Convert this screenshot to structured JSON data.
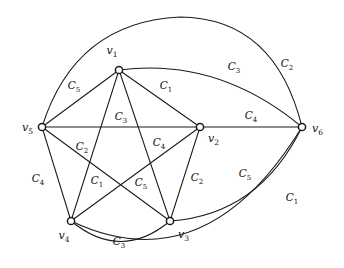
{
  "figure": {
    "kind": "graph-diagram",
    "width": 344,
    "height": 268,
    "background_color": "#ffffff",
    "stroke_color": "#1a1a1a",
    "vertex_fill": "#ffffff"
  },
  "vertices": [
    {
      "id": "v1",
      "label": "v",
      "sub": "1",
      "x": 119,
      "y": 70,
      "label_x": 112,
      "label_y": 54,
      "anchor": "middle"
    },
    {
      "id": "v2",
      "label": "v",
      "sub": "2",
      "x": 200,
      "y": 127,
      "label_x": 208,
      "label_y": 142,
      "anchor": "start"
    },
    {
      "id": "v3",
      "label": "v",
      "sub": "3",
      "x": 170,
      "y": 221,
      "label_x": 178,
      "label_y": 238,
      "anchor": "start"
    },
    {
      "id": "v4",
      "label": "v",
      "sub": "4",
      "x": 71,
      "y": 221,
      "label_x": 64,
      "label_y": 239,
      "anchor": "middle"
    },
    {
      "id": "v5",
      "label": "v",
      "sub": "5",
      "x": 42,
      "y": 127,
      "label_x": 33,
      "label_y": 131,
      "anchor": "end"
    },
    {
      "id": "v6",
      "label": "v",
      "sub": "6",
      "x": 302,
      "y": 127,
      "label_x": 312,
      "label_y": 132,
      "anchor": "start"
    }
  ],
  "edges": [
    {
      "from": "v1",
      "to": "v2",
      "color_label": "C",
      "color_sub": "1",
      "shape": "line",
      "path": "M 119 70 L 200 127",
      "label_x": 166,
      "label_y": 89
    },
    {
      "from": "v1",
      "to": "v3",
      "color_label": "C",
      "color_sub": "4",
      "shape": "line",
      "path": "M 119 70 L 170 221",
      "label_x": 159,
      "label_y": 146
    },
    {
      "from": "v1",
      "to": "v4",
      "color_label": "C",
      "color_sub": "1",
      "shape": "line",
      "path": "M 119 70 L 71 221",
      "label_x": 97,
      "label_y": 184
    },
    {
      "from": "v1",
      "to": "v5",
      "color_label": "C",
      "color_sub": "5",
      "shape": "line",
      "path": "M 119 70 L 42 127",
      "label_x": 74,
      "label_y": 89
    },
    {
      "from": "v1",
      "to": "v6",
      "color_label": "C",
      "color_sub": "3",
      "shape": "arc",
      "path": "M 119 70 Q 218 57 302 127",
      "label_x": 234,
      "label_y": 70
    },
    {
      "from": "v2",
      "to": "v3",
      "color_label": "C",
      "color_sub": "2",
      "shape": "line",
      "path": "M 200 127 L 170 221",
      "label_x": 197,
      "label_y": 181
    },
    {
      "from": "v2",
      "to": "v4",
      "color_label": "C",
      "color_sub": "5",
      "shape": "line",
      "path": "M 200 127 L 71 221",
      "label_x": 141,
      "label_y": 186
    },
    {
      "from": "v2",
      "to": "v5",
      "color_label": "C",
      "color_sub": "3",
      "shape": "line",
      "path": "M 42 127 L 200 127",
      "label_x": 121,
      "label_y": 120
    },
    {
      "from": "v2",
      "to": "v6",
      "color_label": "C",
      "color_sub": "4",
      "shape": "line",
      "path": "M 200 127 L 302 127",
      "label_x": 251,
      "label_y": 119
    },
    {
      "from": "v3",
      "to": "v4",
      "color_label": "C",
      "color_sub": "3",
      "shape": "arc",
      "path": "M 71 221 Q 121 262 170 221",
      "label_x": 119,
      "label_y": 245
    },
    {
      "from": "v3",
      "to": "v5",
      "color_label": "C",
      "color_sub": "2",
      "shape": "line",
      "path": "M 42 127 L 170 221",
      "label_x": 82,
      "label_y": 150
    },
    {
      "from": "v3",
      "to": "v6",
      "color_label": "C",
      "color_sub": "5",
      "shape": "arc",
      "path": "M 170 221 Q 259 215 302 127",
      "label_x": 245,
      "label_y": 177
    },
    {
      "from": "v4",
      "to": "v5",
      "color_label": "C",
      "color_sub": "4",
      "shape": "line",
      "path": "M 42 127 L 71 221",
      "label_x": 38,
      "label_y": 182
    },
    {
      "from": "v4",
      "to": "v6",
      "color_label": "C",
      "color_sub": "1",
      "shape": "arc",
      "path": "M 71 221 Q 205 285 302 127",
      "label_x": 292,
      "label_y": 201
    },
    {
      "from": "v5",
      "to": "v6",
      "color_label": "C",
      "color_sub": "2",
      "shape": "arc",
      "path": "M 42 127 Q 75 22 180 17 Q 275 18 302 127",
      "label_x": 287,
      "label_y": 67
    }
  ],
  "legend": {
    "colors_used": [
      "C1",
      "C2",
      "C3",
      "C4",
      "C5"
    ],
    "vertex_count": 6,
    "edge_count": 15
  }
}
